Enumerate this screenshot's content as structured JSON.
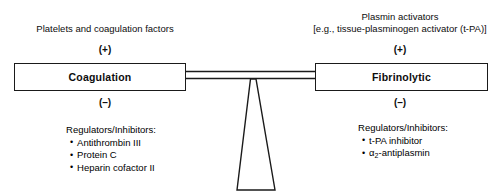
{
  "diagram": {
    "left": {
      "stimulus": "Platelets and coagulation factors",
      "plus_sign": "(+)",
      "box_label": "Coagulation",
      "minus_sign": "(–)",
      "inhibitors_header": "Regulators/Inhibitors:",
      "inhibitors": [
        "Antithrombin III",
        "Protein C",
        "Heparin cofactor II"
      ]
    },
    "right": {
      "stimulus_line1": "Plasmin activators",
      "stimulus_line2": "[e.g., tissue-plasminogen activator (t-PA)]",
      "plus_sign": "(+)",
      "box_label": "Fibrinolytic",
      "minus_sign": "(–)",
      "inhibitors_header": "Regulators/Inhibitors:",
      "inhibitors": [
        {
          "text": "t-PA inhibitor"
        },
        {
          "prefix": "α",
          "subscript": "2",
          "suffix": "-antiplasmin"
        }
      ]
    },
    "fulcrum": {
      "shape": "tapered-trapezoid-pivot"
    },
    "colors": {
      "stroke": "#1a1a1a",
      "text": "#0d0d0d",
      "background": "#ffffff"
    }
  }
}
